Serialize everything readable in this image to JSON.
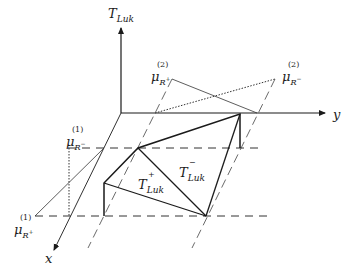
{
  "diagram": {
    "axes": {
      "t_axis": {
        "label_base": "T",
        "label_sub": "Luk"
      },
      "y_axis": {
        "label": "y"
      },
      "x_axis": {
        "label": "x"
      }
    },
    "labels": {
      "mu_r_plus_2": {
        "base": "μ",
        "sup": "(2)",
        "sub": "R",
        "sub_sup": "+"
      },
      "mu_r_minus_2": {
        "base": "μ",
        "sup": "(2)",
        "sub": "R",
        "sub_sup": "−"
      },
      "mu_r_minus_1": {
        "base": "μ",
        "sup": "(1)",
        "sub": "R",
        "sub_sup": "−"
      },
      "mu_r_plus_1": {
        "base": "μ",
        "sup": "(1)",
        "sub": "R",
        "sub_sup": "+"
      },
      "t_luk_plus": {
        "base": "T",
        "sup": "+",
        "sub": "Luk"
      },
      "t_luk_minus": {
        "base": "T",
        "sup": "−",
        "sub": "Luk"
      }
    },
    "colors": {
      "stroke": "#1a1a1a",
      "thin": "#333333"
    }
  }
}
